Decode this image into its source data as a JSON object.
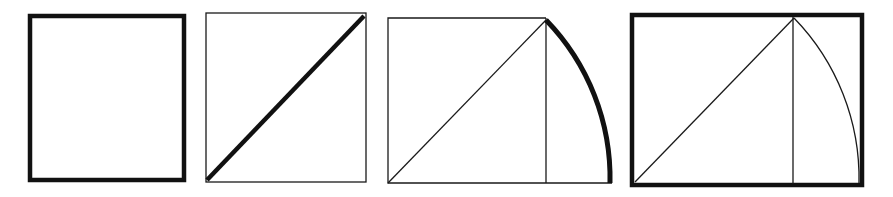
{
  "diagram": {
    "type": "geometric-construction",
    "colors": {
      "ink": "#111111",
      "background": "#ffffff"
    },
    "steps": [
      {
        "id": 1,
        "name": "square",
        "emphasis": "square outline (thick)"
      },
      {
        "id": 2,
        "name": "square-with-diagonal",
        "emphasis": "diagonal (thick)"
      },
      {
        "id": 3,
        "name": "diagonal-swung-as-arc",
        "emphasis": "arc from diagonal end to baseline (thick)"
      },
      {
        "id": 4,
        "name": "root-2-rectangle",
        "emphasis": "resulting rectangle outline (thick)"
      }
    ]
  }
}
